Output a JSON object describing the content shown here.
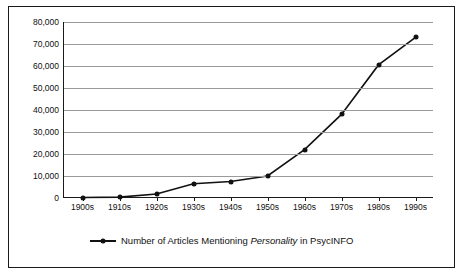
{
  "chart_data": {
    "type": "line",
    "title": "",
    "xlabel": "",
    "ylabel": "",
    "categories": [
      "1900s",
      "1910s",
      "1920s",
      "1930s",
      "1940s",
      "1950s",
      "1960s",
      "1970s",
      "1980s",
      "1990s"
    ],
    "series": [
      {
        "name": "Number of Articles Mentioning Personality in PsycINFO",
        "values": [
          200,
          400,
          1800,
          6500,
          7500,
          10000,
          22000,
          38000,
          60500,
          73000
        ]
      }
    ],
    "ylim": [
      0,
      80000
    ],
    "yticks": [
      0,
      10000,
      20000,
      30000,
      40000,
      50000,
      60000,
      70000,
      80000
    ],
    "ytick_labels": [
      "0",
      "10,000",
      "20,000",
      "30,000",
      "40,000",
      "50,000",
      "60,000",
      "70,000",
      "80,000"
    ],
    "grid": true,
    "legend_position": "bottom",
    "marker": "circle",
    "line_color": "#111111"
  },
  "legend": {
    "entries": [
      {
        "label_prefix": "Number of Articles Mentioning ",
        "label_italic": "Personality",
        "label_suffix": " in PsycINFO"
      }
    ]
  }
}
